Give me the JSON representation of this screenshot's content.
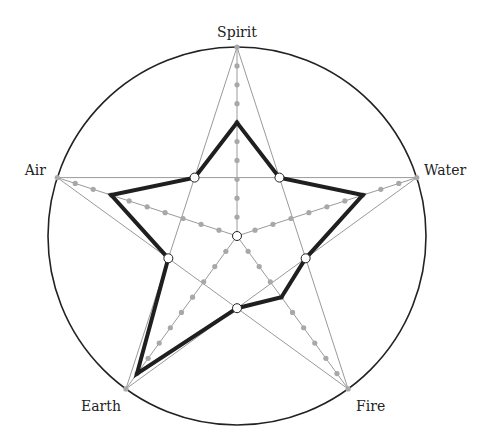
{
  "chart_data": {
    "type": "radar",
    "title": "",
    "axes": [
      "Spirit",
      "Water",
      "Fire",
      "Earth",
      "Air"
    ],
    "scale": {
      "min": 0,
      "max": 10,
      "ticks": 10
    },
    "series": [
      {
        "name": "Elements",
        "values": [
          6,
          7,
          4,
          9,
          7
        ],
        "valley_value": 3.82
      }
    ],
    "grid": "pentagram",
    "legend": null
  },
  "labels": {
    "spirit": "Spirit",
    "water": "Water",
    "fire": "Fire",
    "earth": "Earth",
    "air": "Air"
  },
  "style": {
    "outer_circle": "#222222",
    "grid_line": "#9a9a9a",
    "axis_dot": "#a8a8a8",
    "data_line": "#1f1f1f",
    "marker_stroke": "#222222"
  },
  "geometry": {
    "cx": 237,
    "cy": 236,
    "r": 189
  }
}
